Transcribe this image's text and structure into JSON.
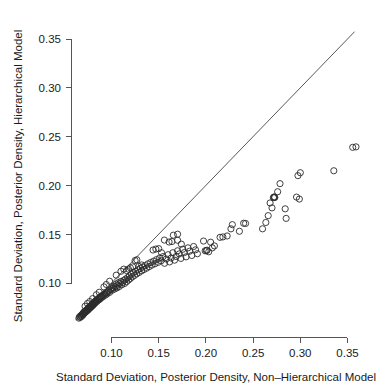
{
  "chart_data": {
    "type": "scatter",
    "title": "",
    "xlabel": "Standard Deviation, Posterior Density, Non–Hierarchical Model",
    "ylabel": "Standard Deviation, Posterior Density, Hierarchical Model",
    "xlim": [
      0.06,
      0.365
    ],
    "ylim": [
      0.058,
      0.362
    ],
    "xticks": [
      0.1,
      0.15,
      0.2,
      0.25,
      0.3,
      0.35
    ],
    "xticklabels": [
      "0.10",
      "0.15",
      "0.20",
      "0.25",
      "0.30",
      "0.35"
    ],
    "yticks": [
      0.1,
      0.15,
      0.2,
      0.25,
      0.3,
      0.35
    ],
    "yticklabels": [
      "0.10",
      "0.15",
      "0.20",
      "0.25",
      "0.30",
      "0.35"
    ],
    "grid": false,
    "legend": null,
    "marker": "open-circle",
    "marker_size": 4.2,
    "annotations": [
      {
        "type": "reference-line",
        "name": "identity-line",
        "label": "y = x",
        "from": [
          0.062,
          0.062
        ],
        "to": [
          0.3575,
          0.3575
        ]
      }
    ],
    "points": [
      [
        0.0655,
        0.064
      ],
      [
        0.0662,
        0.0655
      ],
      [
        0.0668,
        0.0648
      ],
      [
        0.0674,
        0.0662
      ],
      [
        0.068,
        0.067
      ],
      [
        0.0684,
        0.0658
      ],
      [
        0.069,
        0.0676
      ],
      [
        0.0694,
        0.0684
      ],
      [
        0.0698,
        0.0672
      ],
      [
        0.0702,
        0.069
      ],
      [
        0.0706,
        0.07
      ],
      [
        0.071,
        0.0688
      ],
      [
        0.0714,
        0.0706
      ],
      [
        0.0718,
        0.0696
      ],
      [
        0.0722,
        0.0712
      ],
      [
        0.0726,
        0.0704
      ],
      [
        0.073,
        0.0718
      ],
      [
        0.0734,
        0.071
      ],
      [
        0.0738,
        0.0724
      ],
      [
        0.0742,
        0.073
      ],
      [
        0.0746,
        0.0718
      ],
      [
        0.075,
        0.0736
      ],
      [
        0.0754,
        0.0744
      ],
      [
        0.0758,
        0.073
      ],
      [
        0.0762,
        0.075
      ],
      [
        0.0766,
        0.074
      ],
      [
        0.077,
        0.0756
      ],
      [
        0.0774,
        0.0762
      ],
      [
        0.0778,
        0.0748
      ],
      [
        0.0782,
        0.0768
      ],
      [
        0.0786,
        0.0758
      ],
      [
        0.079,
        0.0774
      ],
      [
        0.0794,
        0.078
      ],
      [
        0.0798,
        0.0766
      ],
      [
        0.0802,
        0.0786
      ],
      [
        0.0806,
        0.0776
      ],
      [
        0.081,
        0.0792
      ],
      [
        0.0814,
        0.08
      ],
      [
        0.0818,
        0.0786
      ],
      [
        0.0822,
        0.0806
      ],
      [
        0.0826,
        0.0796
      ],
      [
        0.083,
        0.0812
      ],
      [
        0.0835,
        0.082
      ],
      [
        0.084,
        0.0806
      ],
      [
        0.0845,
        0.0826
      ],
      [
        0.085,
        0.0816
      ],
      [
        0.0856,
        0.0834
      ],
      [
        0.0862,
        0.0842
      ],
      [
        0.0868,
        0.0828
      ],
      [
        0.0874,
        0.085
      ],
      [
        0.088,
        0.0838
      ],
      [
        0.0886,
        0.0858
      ],
      [
        0.0892,
        0.0866
      ],
      [
        0.0898,
        0.0852
      ],
      [
        0.0905,
        0.0874
      ],
      [
        0.0912,
        0.0862
      ],
      [
        0.092,
        0.0882
      ],
      [
        0.0928,
        0.0892
      ],
      [
        0.0936,
        0.0876
      ],
      [
        0.0944,
        0.09
      ],
      [
        0.0952,
        0.0888
      ],
      [
        0.096,
        0.091
      ],
      [
        0.097,
        0.092
      ],
      [
        0.098,
        0.0904
      ],
      [
        0.099,
        0.093
      ],
      [
        0.1,
        0.0944
      ],
      [
        0.1008,
        0.0926
      ],
      [
        0.1016,
        0.0952
      ],
      [
        0.1024,
        0.0968
      ],
      [
        0.1032,
        0.0938
      ],
      [
        0.104,
        0.0962
      ],
      [
        0.105,
        0.099
      ],
      [
        0.1058,
        0.095
      ],
      [
        0.1066,
        0.0978
      ],
      [
        0.1074,
        0.1004
      ],
      [
        0.1082,
        0.0964
      ],
      [
        0.109,
        0.0996
      ],
      [
        0.11,
        0.1016
      ],
      [
        0.111,
        0.0982
      ],
      [
        0.112,
        0.1006
      ],
      [
        0.113,
        0.1028
      ],
      [
        0.114,
        0.0996
      ],
      [
        0.115,
        0.104
      ],
      [
        0.116,
        0.1014
      ],
      [
        0.117,
        0.1056
      ],
      [
        0.118,
        0.103
      ],
      [
        0.119,
        0.1072
      ],
      [
        0.12,
        0.1046
      ],
      [
        0.121,
        0.109
      ],
      [
        0.122,
        0.1062
      ],
      [
        0.1232,
        0.1106
      ],
      [
        0.1244,
        0.1078
      ],
      [
        0.1256,
        0.112
      ],
      [
        0.1268,
        0.1094
      ],
      [
        0.128,
        0.1136
      ],
      [
        0.1292,
        0.1108
      ],
      [
        0.1305,
        0.115
      ],
      [
        0.1318,
        0.1124
      ],
      [
        0.133,
        0.1164
      ],
      [
        0.1344,
        0.1138
      ],
      [
        0.1358,
        0.1178
      ],
      [
        0.1372,
        0.1152
      ],
      [
        0.1386,
        0.1196
      ],
      [
        0.14,
        0.1168
      ],
      [
        0.1415,
        0.121
      ],
      [
        0.143,
        0.1184
      ],
      [
        0.1446,
        0.1224
      ],
      [
        0.1462,
        0.1198
      ],
      [
        0.1478,
        0.124
      ],
      [
        0.1494,
        0.1212
      ],
      [
        0.151,
        0.1256
      ],
      [
        0.1526,
        0.1228
      ],
      [
        0.1545,
        0.127
      ],
      [
        0.1562,
        0.1202
      ],
      [
        0.158,
        0.1246
      ],
      [
        0.16,
        0.129
      ],
      [
        0.1615,
        0.1216
      ],
      [
        0.1632,
        0.1256
      ],
      [
        0.165,
        0.131
      ],
      [
        0.1668,
        0.1234
      ],
      [
        0.1685,
        0.1272
      ],
      [
        0.17,
        0.133
      ],
      [
        0.1718,
        0.1298
      ],
      [
        0.1735,
        0.1252
      ],
      [
        0.1755,
        0.1346
      ],
      [
        0.1772,
        0.1312
      ],
      [
        0.179,
        0.1268
      ],
      [
        0.181,
        0.136
      ],
      [
        0.1828,
        0.1326
      ],
      [
        0.185,
        0.1282
      ],
      [
        0.187,
        0.1374
      ],
      [
        0.189,
        0.134
      ],
      [
        0.191,
        0.13
      ],
      [
        0.1655,
        0.149
      ],
      [
        0.17,
        0.15
      ],
      [
        0.156,
        0.144
      ],
      [
        0.1975,
        0.143
      ],
      [
        0.1992,
        0.133
      ],
      [
        0.2005,
        0.1332
      ],
      [
        0.2012,
        0.1336
      ],
      [
        0.203,
        0.132
      ],
      [
        0.205,
        0.1418
      ],
      [
        0.2068,
        0.136
      ],
      [
        0.209,
        0.138
      ],
      [
        0.215,
        0.1468
      ],
      [
        0.218,
        0.1472
      ],
      [
        0.2225,
        0.1482
      ],
      [
        0.2265,
        0.1555
      ],
      [
        0.228,
        0.1598
      ],
      [
        0.2355,
        0.153
      ],
      [
        0.24,
        0.1612
      ],
      [
        0.242,
        0.161
      ],
      [
        0.26,
        0.1555
      ],
      [
        0.2635,
        0.162
      ],
      [
        0.266,
        0.169
      ],
      [
        0.27,
        0.177
      ],
      [
        0.268,
        0.182
      ],
      [
        0.2715,
        0.1875
      ],
      [
        0.272,
        0.1878
      ],
      [
        0.2725,
        0.1882
      ],
      [
        0.273,
        0.1876
      ],
      [
        0.276,
        0.1935
      ],
      [
        0.2785,
        0.2018
      ],
      [
        0.284,
        0.176
      ],
      [
        0.285,
        0.1662
      ],
      [
        0.296,
        0.188
      ],
      [
        0.299,
        0.186
      ],
      [
        0.3,
        0.213
      ],
      [
        0.2975,
        0.21
      ],
      [
        0.3355,
        0.215
      ],
      [
        0.359,
        0.2395
      ],
      [
        0.3555,
        0.239
      ],
      [
        0.125,
        0.123
      ],
      [
        0.1268,
        0.1238
      ],
      [
        0.129,
        0.117
      ],
      [
        0.132,
        0.1185
      ],
      [
        0.11,
        0.112
      ],
      [
        0.113,
        0.1142
      ],
      [
        0.105,
        0.108
      ],
      [
        0.098,
        0.1018
      ],
      [
        0.144,
        0.1338
      ],
      [
        0.147,
        0.1348
      ],
      [
        0.15,
        0.1352
      ],
      [
        0.153,
        0.131
      ],
      [
        0.161,
        0.142
      ],
      [
        0.164,
        0.1425
      ],
      [
        0.17,
        0.1438
      ],
      [
        0.174,
        0.1398
      ],
      [
        0.092,
        0.096
      ],
      [
        0.0945,
        0.0985
      ],
      [
        0.087,
        0.0905
      ],
      [
        0.084,
        0.088
      ],
      [
        0.08,
        0.084
      ],
      [
        0.077,
        0.081
      ],
      [
        0.0745,
        0.079
      ],
      [
        0.072,
        0.0762
      ],
      [
        0.12,
        0.1155
      ],
      [
        0.1225,
        0.1165
      ],
      [
        0.116,
        0.1128
      ],
      [
        0.118,
        0.1142
      ]
    ]
  }
}
